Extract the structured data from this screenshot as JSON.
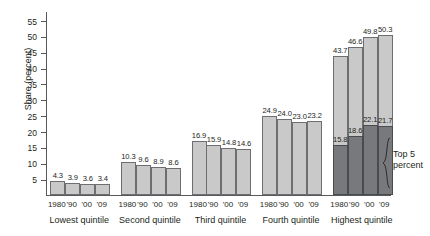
{
  "chart_data": {
    "type": "bar",
    "title": "",
    "subtitle": "",
    "xlabel": "",
    "ylabel": "Share (percent)",
    "ylim": [
      0,
      58
    ],
    "yticks": [
      5,
      10,
      15,
      20,
      25,
      30,
      35,
      40,
      45,
      50,
      55
    ],
    "grid": false,
    "legend_position": "none",
    "categories": [
      "Lowest quintile",
      "Second quintile",
      "Third quintile",
      "Fourth quintile",
      "Highest quintile"
    ],
    "x": [
      "1980",
      "'90",
      "'00",
      "'09"
    ],
    "series": [
      {
        "name": "Share of aggregate income",
        "values": [
          [
            4.3,
            3.9,
            3.6,
            3.4
          ],
          [
            10.3,
            9.6,
            8.9,
            8.6
          ],
          [
            16.9,
            15.9,
            14.8,
            14.6
          ],
          [
            24.9,
            24.0,
            23.0,
            23.2
          ],
          [
            43.7,
            46.6,
            49.8,
            50.3
          ]
        ]
      },
      {
        "name": "Top 5 percent",
        "values": [
          [
            null,
            null,
            null,
            null
          ],
          [
            null,
            null,
            null,
            null
          ],
          [
            null,
            null,
            null,
            null
          ],
          [
            null,
            null,
            null,
            null
          ],
          [
            15.8,
            18.6,
            22.1,
            21.7
          ]
        ]
      }
    ],
    "annotations": [
      {
        "text_line1": "Top 5",
        "text_line2": "percent",
        "target": "Highest quintile overlay bars"
      }
    ],
    "colors": {
      "bar_fill": "#c9c9c9",
      "bar_stroke": "#6d6e71",
      "overlay_fill": "#78797c",
      "overlay_stroke": "#4a4b4d",
      "axis": "#58595b",
      "text": "#231f20"
    }
  },
  "axis": {
    "y_title": "Share (percent)",
    "y_ticks": [
      "55",
      "50",
      "45",
      "40",
      "35",
      "30",
      "25",
      "20",
      "15",
      "10",
      "5"
    ]
  },
  "groups": [
    {
      "label": "Lowest quintile",
      "bars": [
        {
          "year": "1980",
          "value": "4.3"
        },
        {
          "year": "'90",
          "value": "3.9"
        },
        {
          "year": "'00",
          "value": "3.6"
        },
        {
          "year": "'09",
          "value": "3.4"
        }
      ]
    },
    {
      "label": "Second quintile",
      "bars": [
        {
          "year": "1980",
          "value": "10.3"
        },
        {
          "year": "'90",
          "value": "9.6"
        },
        {
          "year": "'00",
          "value": "8.9"
        },
        {
          "year": "'09",
          "value": "8.6"
        }
      ]
    },
    {
      "label": "Third quintile",
      "bars": [
        {
          "year": "1980",
          "value": "16.9"
        },
        {
          "year": "'90",
          "value": "15.9"
        },
        {
          "year": "'00",
          "value": "14.8"
        },
        {
          "year": "'09",
          "value": "14.6"
        }
      ]
    },
    {
      "label": "Fourth quintile",
      "bars": [
        {
          "year": "1980",
          "value": "24.9"
        },
        {
          "year": "'90",
          "value": "24.0"
        },
        {
          "year": "'00",
          "value": "23.0"
        },
        {
          "year": "'09",
          "value": "23.2"
        }
      ]
    },
    {
      "label": "Highest quintile",
      "bars": [
        {
          "year": "1980",
          "value": "43.7",
          "sub_value": "15.8"
        },
        {
          "year": "'90",
          "value": "46.6",
          "sub_value": "18.6"
        },
        {
          "year": "'00",
          "value": "49.8",
          "sub_value": "22.1"
        },
        {
          "year": "'09",
          "value": "50.3",
          "sub_value": "21.7"
        }
      ]
    }
  ],
  "annotation": {
    "line1": "Top 5",
    "line2": "percent"
  }
}
